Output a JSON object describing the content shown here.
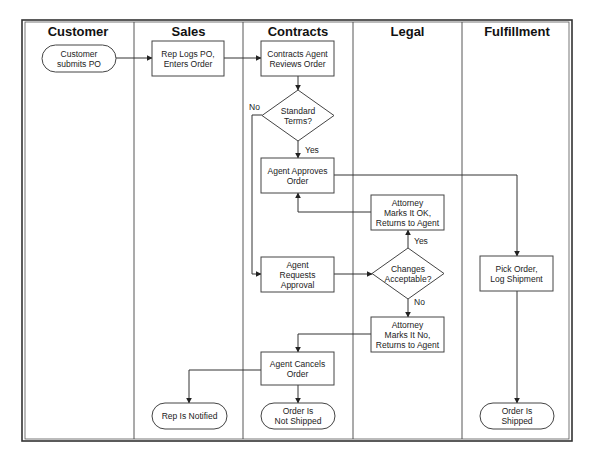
{
  "diagram": {
    "type": "swimlane-flowchart",
    "frame": {
      "x": 22,
      "y": 20,
      "width": 550,
      "height": 421
    },
    "lanes": [
      {
        "id": "customer",
        "title": "Customer",
        "x": 22,
        "width": 112
      },
      {
        "id": "sales",
        "title": "Sales",
        "x": 134,
        "width": 109
      },
      {
        "id": "contracts",
        "title": "Contracts",
        "x": 243,
        "width": 110
      },
      {
        "id": "legal",
        "title": "Legal",
        "x": 353,
        "width": 109
      },
      {
        "id": "fulfillment",
        "title": "Fulfillment",
        "x": 462,
        "width": 110
      }
    ],
    "nodes": [
      {
        "id": "n1",
        "shape": "terminal",
        "lane": "customer",
        "lines": [
          "Customer",
          "submits PO"
        ],
        "x": 42,
        "y": 45,
        "w": 74,
        "h": 27
      },
      {
        "id": "n2",
        "shape": "process",
        "lane": "sales",
        "lines": [
          "Rep Logs PO,",
          "Enters Order"
        ],
        "x": 152,
        "y": 41,
        "w": 72,
        "h": 35
      },
      {
        "id": "n3",
        "shape": "process",
        "lane": "contracts",
        "lines": [
          "Contracts Agent",
          "Reviews Order"
        ],
        "x": 261,
        "y": 41,
        "w": 73,
        "h": 35
      },
      {
        "id": "n4",
        "shape": "decision",
        "lane": "contracts",
        "lines": [
          "Standard",
          "Terms?"
        ],
        "x": 262,
        "y": 90,
        "w": 72,
        "h": 51
      },
      {
        "id": "n5",
        "shape": "process",
        "lane": "contracts",
        "lines": [
          "Agent Approves",
          "Order"
        ],
        "x": 261,
        "y": 158,
        "w": 73,
        "h": 35
      },
      {
        "id": "n6",
        "shape": "process",
        "lane": "legal",
        "lines": [
          "Attorney",
          "Marks It OK,",
          "Returns to Agent"
        ],
        "x": 371,
        "y": 195,
        "w": 73,
        "h": 35
      },
      {
        "id": "n7",
        "shape": "process",
        "lane": "contracts",
        "lines": [
          "Agent",
          "Requests",
          "Approval"
        ],
        "x": 261,
        "y": 257,
        "w": 73,
        "h": 35
      },
      {
        "id": "n8",
        "shape": "decision",
        "lane": "legal",
        "lines": [
          "Changes",
          "Acceptable?"
        ],
        "x": 372,
        "y": 248,
        "w": 72,
        "h": 51
      },
      {
        "id": "n9",
        "shape": "process",
        "lane": "legal",
        "lines": [
          "Attorney",
          "Marks It No,",
          "Returns to Agent"
        ],
        "x": 371,
        "y": 317,
        "w": 73,
        "h": 35
      },
      {
        "id": "n10",
        "shape": "process",
        "lane": "contracts",
        "lines": [
          "Agent Cancels",
          "Order"
        ],
        "x": 261,
        "y": 352,
        "w": 73,
        "h": 33
      },
      {
        "id": "n11",
        "shape": "terminal",
        "lane": "sales",
        "lines": [
          "Rep Is Notified"
        ],
        "x": 152,
        "y": 403,
        "w": 75,
        "h": 26
      },
      {
        "id": "n12",
        "shape": "terminal",
        "lane": "contracts",
        "lines": [
          "Order Is",
          "Not Shipped"
        ],
        "x": 261,
        "y": 403,
        "w": 74,
        "h": 26
      },
      {
        "id": "n13",
        "shape": "process",
        "lane": "fulfillment",
        "lines": [
          "Pick Order,",
          "Log Shipment"
        ],
        "x": 480,
        "y": 256,
        "w": 73,
        "h": 35
      },
      {
        "id": "n14",
        "shape": "terminal",
        "lane": "fulfillment",
        "lines": [
          "Order Is",
          "Shipped"
        ],
        "x": 480,
        "y": 403,
        "w": 74,
        "h": 26
      }
    ],
    "edges": [
      {
        "from": "n1",
        "to": "n2",
        "label": "",
        "points": [
          [
            116,
            58
          ],
          [
            152,
            58
          ]
        ]
      },
      {
        "from": "n2",
        "to": "n3",
        "label": "",
        "points": [
          [
            224,
            58
          ],
          [
            261,
            58
          ]
        ]
      },
      {
        "from": "n3",
        "to": "n4",
        "label": "",
        "points": [
          [
            298,
            76
          ],
          [
            298,
            90
          ]
        ]
      },
      {
        "from": "n4",
        "to": "n5",
        "label": "Yes",
        "label_pos": [
          305,
          153
        ],
        "points": [
          [
            298,
            141
          ],
          [
            298,
            158
          ]
        ]
      },
      {
        "from": "n4",
        "to": "n7",
        "label": "No",
        "label_pos": [
          249,
          110
        ],
        "points": [
          [
            262,
            115
          ],
          [
            252,
            115
          ],
          [
            252,
            274
          ],
          [
            261,
            274
          ]
        ]
      },
      {
        "from": "n5",
        "to": "n13",
        "label": "",
        "points": [
          [
            334,
            175
          ],
          [
            517,
            175
          ],
          [
            517,
            256
          ]
        ]
      },
      {
        "from": "n6",
        "to": "n5",
        "label": "",
        "points": [
          [
            371,
            212
          ],
          [
            298,
            212
          ],
          [
            298,
            193
          ]
        ]
      },
      {
        "from": "n7",
        "to": "n8",
        "label": "",
        "points": [
          [
            334,
            274
          ],
          [
            372,
            274
          ]
        ]
      },
      {
        "from": "n8",
        "to": "n6",
        "label": "Yes",
        "label_pos": [
          414,
          244
        ],
        "points": [
          [
            408,
            248
          ],
          [
            408,
            230
          ]
        ]
      },
      {
        "from": "n8",
        "to": "n9",
        "label": "No",
        "label_pos": [
          414,
          305
        ],
        "points": [
          [
            408,
            299
          ],
          [
            408,
            317
          ]
        ]
      },
      {
        "from": "n9",
        "to": "n10",
        "label": "",
        "points": [
          [
            371,
            334
          ],
          [
            298,
            334
          ],
          [
            298,
            352
          ]
        ]
      },
      {
        "from": "n10",
        "to": "n11",
        "label": "",
        "points": [
          [
            261,
            370
          ],
          [
            189,
            370
          ],
          [
            189,
            403
          ]
        ]
      },
      {
        "from": "n10",
        "to": "n12",
        "label": "",
        "points": [
          [
            298,
            385
          ],
          [
            298,
            403
          ]
        ]
      },
      {
        "from": "n13",
        "to": "n14",
        "label": "",
        "points": [
          [
            517,
            291
          ],
          [
            517,
            403
          ]
        ]
      }
    ]
  },
  "colors": {
    "line": "#333333",
    "frame": "#333333",
    "shape_fill": "#ffffff",
    "text": "#222222"
  }
}
